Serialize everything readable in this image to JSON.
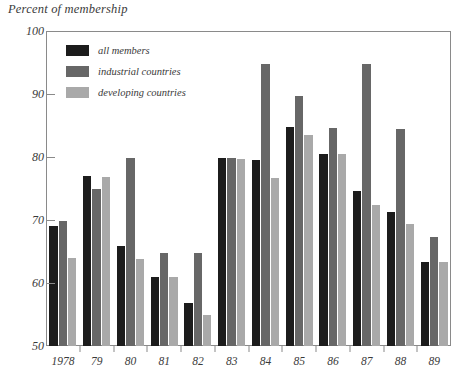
{
  "chart_data": {
    "type": "bar",
    "title": "",
    "ylabel": "Percent of membership",
    "xlabel": "",
    "ylim": [
      50,
      100
    ],
    "yticks": [
      50,
      60,
      70,
      80,
      90,
      100
    ],
    "grid": false,
    "legend_position": "upper-left-inside",
    "categories": [
      "1978",
      "79",
      "80",
      "81",
      "82",
      "83",
      "84",
      "85",
      "86",
      "87",
      "88",
      "89"
    ],
    "series": [
      {
        "name": "all members",
        "color": "#1c1c1c",
        "values": [
          69.0,
          77.0,
          65.8,
          60.9,
          56.8,
          79.8,
          79.6,
          84.7,
          80.5,
          74.6,
          71.2,
          63.4
        ]
      },
      {
        "name": "industrial countries",
        "color": "#676767",
        "values": [
          69.9,
          75.0,
          79.9,
          64.8,
          64.8,
          79.8,
          94.7,
          89.7,
          84.6,
          94.7,
          84.4,
          67.3
        ]
      },
      {
        "name": "developing countries",
        "color": "#a9a9a9",
        "values": [
          63.9,
          76.8,
          63.8,
          61.0,
          55.0,
          79.7,
          76.7,
          83.5,
          80.5,
          72.4,
          69.4,
          63.3
        ]
      }
    ]
  },
  "legend": {
    "items": [
      {
        "label": "all members",
        "color": "#1c1c1c"
      },
      {
        "label": "industrial countries",
        "color": "#676767"
      },
      {
        "label": "developing countries",
        "color": "#a9a9a9"
      }
    ]
  },
  "axis": {
    "y_title": "Percent of membership",
    "y_tick_labels": [
      "100",
      "90",
      "80",
      "70",
      "60",
      "50"
    ],
    "x_tick_labels": [
      "1978",
      "79",
      "80",
      "81",
      "82",
      "83",
      "84",
      "85",
      "86",
      "87",
      "88",
      "89"
    ]
  }
}
